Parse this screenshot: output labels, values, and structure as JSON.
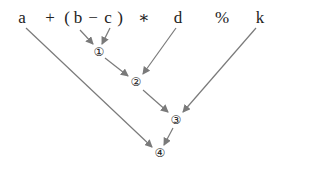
{
  "expression": {
    "tokens": [
      {
        "text": "a",
        "x": 22
      },
      {
        "text": "+",
        "x": 50
      },
      {
        "text": "(",
        "x": 67
      },
      {
        "text": "b",
        "x": 78
      },
      {
        "text": "−",
        "x": 93
      },
      {
        "text": "c",
        "x": 108
      },
      {
        "text": ")",
        "x": 120
      },
      {
        "text": "∗",
        "x": 144
      },
      {
        "text": "d",
        "x": 178
      },
      {
        "text": "%",
        "x": 222
      },
      {
        "text": "k",
        "x": 260
      }
    ]
  },
  "nodes": [
    {
      "label": "①",
      "x": 99,
      "y": 52
    },
    {
      "label": "②",
      "x": 136,
      "y": 82
    },
    {
      "label": "③",
      "x": 176,
      "y": 120
    },
    {
      "label": "④",
      "x": 160,
      "y": 153
    }
  ],
  "edges": [
    {
      "from": "b",
      "to": "①"
    },
    {
      "from": "c",
      "to": "①"
    },
    {
      "from": "①",
      "to": "②"
    },
    {
      "from": "d",
      "to": "②"
    },
    {
      "from": "②",
      "to": "③"
    },
    {
      "from": "k",
      "to": "③"
    },
    {
      "from": "a",
      "to": "④"
    },
    {
      "from": "③",
      "to": "④"
    }
  ],
  "colors": {
    "arrow": "#7a7a7a",
    "text": "#222222"
  }
}
